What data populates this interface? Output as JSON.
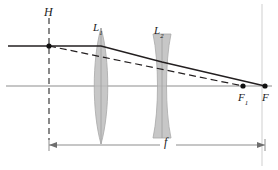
{
  "figure": {
    "kind": "optics-ray-diagram",
    "width": 278,
    "height": 170,
    "background_color": "#ffffff"
  },
  "labels": {
    "principal_plane": "H",
    "lens_1": "L",
    "lens_1_sub": "1",
    "lens_2": "L",
    "lens_2_sub": "2",
    "focal_point_1": "F",
    "focal_point_1_sub": "1",
    "focal_point": "F",
    "focal_length": "f"
  },
  "colors": {
    "ray_solid": "#231f20",
    "ray_dashed": "#231f20",
    "optical_axis": "#8d8d8d",
    "principal_plane_line": "#3b3b3b",
    "lens_glass": "#b8b8b8",
    "lens_glass_edge": "#9a9a9a",
    "dimension_line": "#8d8d8d",
    "vertical_guide": "#c9c9c9",
    "point_marker": "#111111"
  },
  "geometry": {
    "optical_axis_y": 86,
    "principal_plane_x": 49,
    "lens_1_x": 101,
    "lens_2_x": 162,
    "focal_point_1_x": 243,
    "focal_point_x": 265,
    "incoming_ray_y": 46,
    "dimension_line_y": 145
  },
  "optics": {
    "lens_1_type": "biconvex-converging",
    "lens_2_type": "biconcave-diverging",
    "rays": [
      {
        "name": "solid-marginal-ray",
        "style": "solid",
        "from_x": 8,
        "from_y": 46,
        "to_x": 265,
        "to_y": 86
      },
      {
        "name": "dashed-equivalent-ray",
        "style": "dashed",
        "from_x": 49,
        "from_y": 46,
        "to_x": 243,
        "to_y": 86
      }
    ]
  }
}
